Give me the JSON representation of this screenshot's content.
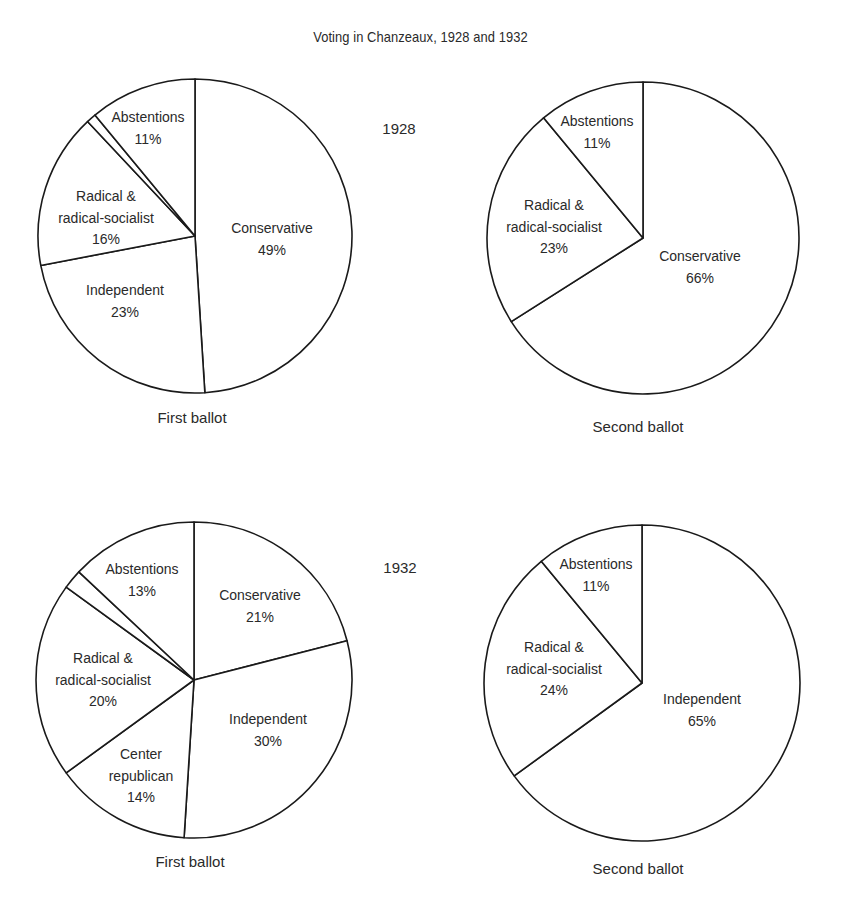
{
  "title": "Voting in Chanzeaux, 1928 and 1932",
  "chart_data": [
    {
      "type": "pie",
      "year": "1928",
      "title": "First ballot",
      "center": [
        195,
        236
      ],
      "radius": 157,
      "slices": [
        {
          "label": "Conservative",
          "value": 49,
          "pct_text": "49%",
          "label_lines": [
            "Conservative",
            "49%"
          ],
          "label_pos": [
            272,
            228
          ]
        },
        {
          "label": "Independent",
          "value": 23,
          "pct_text": "23%",
          "label_lines": [
            "Independent",
            "23%"
          ],
          "label_pos": [
            125,
            290
          ]
        },
        {
          "label": "Radical & radical-socialist",
          "value": 16,
          "pct_text": "16%",
          "label_lines": [
            "Radical &",
            "radical-socialist",
            "16%"
          ],
          "label_pos": [
            106,
            196
          ]
        },
        {
          "label": "",
          "value": 1,
          "pct_text": "",
          "label_lines": [],
          "label_pos": null
        },
        {
          "label": "Abstentions",
          "value": 11,
          "pct_text": "11%",
          "label_lines": [
            "Abstentions",
            "11%"
          ],
          "label_pos": [
            148,
            117
          ]
        }
      ],
      "caption_pos": [
        192,
        418
      ]
    },
    {
      "type": "pie",
      "year": "1928",
      "title": "Second ballot",
      "center": [
        643,
        238
      ],
      "radius": 156,
      "slices": [
        {
          "label": "Conservative",
          "value": 66,
          "pct_text": "66%",
          "label_lines": [
            "Conservative",
            "66%"
          ],
          "label_pos": [
            700,
            256
          ]
        },
        {
          "label": "Radical & radical-socialist",
          "value": 23,
          "pct_text": "23%",
          "label_lines": [
            "Radical &",
            "radical-socialist",
            "23%"
          ],
          "label_pos": [
            554,
            205
          ]
        },
        {
          "label": "Abstentions",
          "value": 11,
          "pct_text": "11%",
          "label_lines": [
            "Abstentions",
            "11%"
          ],
          "label_pos": [
            597,
            121
          ]
        }
      ],
      "caption_pos": [
        638,
        427
      ]
    },
    {
      "type": "pie",
      "year": "1932",
      "title": "First ballot",
      "center": [
        194,
        680
      ],
      "radius": 158,
      "slices": [
        {
          "label": "Conservative",
          "value": 21,
          "pct_text": "21%",
          "label_lines": [
            "Conservative",
            "21%"
          ],
          "label_pos": [
            260,
            595
          ]
        },
        {
          "label": "Independent",
          "value": 30,
          "pct_text": "30%",
          "label_lines": [
            "Independent",
            "30%"
          ],
          "label_pos": [
            268,
            719
          ]
        },
        {
          "label": "Center republican",
          "value": 14,
          "pct_text": "14%",
          "label_lines": [
            "Center",
            "republican",
            "14%"
          ],
          "label_pos": [
            141,
            754
          ]
        },
        {
          "label": "Radical & radical-socialist",
          "value": 20,
          "pct_text": "20%",
          "label_lines": [
            "Radical &",
            "radical-socialist",
            "20%"
          ],
          "label_pos": [
            103,
            658
          ]
        },
        {
          "label": "",
          "value": 2,
          "pct_text": "",
          "label_lines": [],
          "label_pos": null
        },
        {
          "label": "Abstentions",
          "value": 13,
          "pct_text": "13%",
          "label_lines": [
            "Abstentions",
            "13%"
          ],
          "label_pos": [
            142,
            569
          ]
        }
      ],
      "caption_pos": [
        190,
        862
      ]
    },
    {
      "type": "pie",
      "year": "1932",
      "title": "Second ballot",
      "center": [
        642,
        683
      ],
      "radius": 158,
      "slices": [
        {
          "label": "Independent",
          "value": 65,
          "pct_text": "65%",
          "label_lines": [
            "Independent",
            "65%"
          ],
          "label_pos": [
            702,
            699
          ]
        },
        {
          "label": "Radical & radical-socialist",
          "value": 24,
          "pct_text": "24%",
          "label_lines": [
            "Radical &",
            "radical-socialist",
            "24%"
          ],
          "label_pos": [
            554,
            647
          ]
        },
        {
          "label": "Abstentions",
          "value": 11,
          "pct_text": "11%",
          "label_lines": [
            "Abstentions",
            "11%"
          ],
          "label_pos": [
            596,
            564
          ]
        }
      ],
      "caption_pos": [
        638,
        869
      ]
    }
  ],
  "years": [
    {
      "label": "1928",
      "pos": [
        399,
        134
      ]
    },
    {
      "label": "1932",
      "pos": [
        400,
        573
      ]
    }
  ],
  "colors": {
    "stroke": "#1a1a1a",
    "fill": "#ffffff",
    "text": "#2a2a2a"
  }
}
